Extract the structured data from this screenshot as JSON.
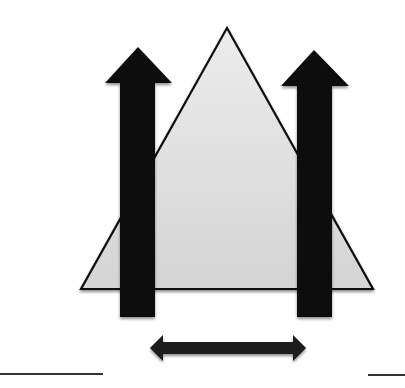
{
  "diagram": {
    "title": "",
    "colors": {
      "background": "#ffffff",
      "triangle_fill": "#d9d9d9",
      "triangle_stroke": "#111111",
      "arrow_fill": "#111111",
      "line": "#333333"
    },
    "elements": [
      {
        "id": "triangle",
        "type": "triangle",
        "apex": [
          227,
          28
        ],
        "base_left": [
          81,
          289
        ],
        "base_right": [
          373,
          289
        ]
      },
      {
        "id": "left-up-arrow",
        "type": "arrow-up",
        "shaft_x": [
          120,
          155
        ],
        "shaft_bottom": 317,
        "head_apex": [
          138,
          47
        ],
        "head_base_y": 83,
        "head_x": [
          105,
          172
        ]
      },
      {
        "id": "right-up-arrow",
        "type": "arrow-up",
        "shaft_x": [
          297,
          332
        ],
        "shaft_bottom": 317,
        "head_apex": [
          314,
          50
        ],
        "head_base_y": 86,
        "head_x": [
          281,
          349
        ]
      },
      {
        "id": "double-arrow",
        "type": "arrow-horizontal-double",
        "x": [
          150,
          306
        ],
        "y": 348
      },
      {
        "id": "left-ground-line",
        "type": "line",
        "x": [
          0,
          103
        ],
        "y": 374
      },
      {
        "id": "right-ground-line",
        "type": "line",
        "x": [
          368,
          405
        ],
        "y": 375
      }
    ]
  }
}
